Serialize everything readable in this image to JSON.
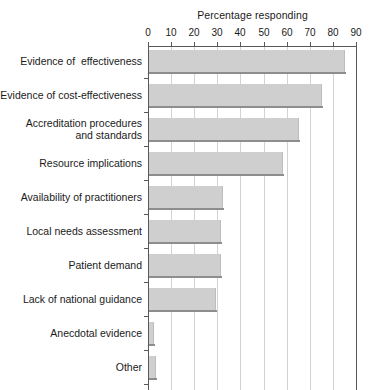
{
  "chart_data": {
    "type": "bar",
    "orientation": "horizontal",
    "title": "Percentage responding",
    "xlabel": "Percentage responding",
    "ylabel": "",
    "xlim": [
      0,
      90
    ],
    "xticks": [
      0,
      10,
      20,
      30,
      40,
      50,
      60,
      70,
      80,
      90
    ],
    "grid": true,
    "legend": null,
    "categories": [
      "Evidence of  effectiveness",
      "Evidence of cost-effectiveness",
      "Accreditation procedures\nand standards",
      "Resource implications",
      "Availability of practitioners",
      "Local needs assessment",
      "Patient demand",
      "Lack of national guidance",
      "Anecdotal evidence",
      "Other"
    ],
    "values": [
      85,
      75,
      65,
      58,
      32,
      31,
      31,
      29,
      2,
      3
    ],
    "colors": {
      "bar_fill": "#cfcfcf",
      "bar_edge": "#8d8d8f",
      "gridline": "#d2d2d4",
      "axis": "#58585a",
      "text": "#1a1a1a",
      "background": "#ffffff"
    }
  },
  "category_lines": [
    [
      "Evidence of  effectiveness"
    ],
    [
      "Evidence of cost-effectiveness"
    ],
    [
      "Accreditation procedures",
      "and standards"
    ],
    [
      "Resource implications"
    ],
    [
      "Availability of practitioners"
    ],
    [
      "Local needs assessment"
    ],
    [
      "Patient demand"
    ],
    [
      "Lack of national guidance"
    ],
    [
      "Anecdotal evidence"
    ],
    [
      "Other"
    ]
  ]
}
